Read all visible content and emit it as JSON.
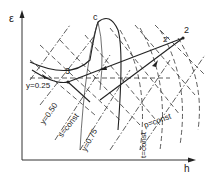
{
  "diagram": {
    "type": "thermodynamic-state-diagram",
    "axes": {
      "y_label": "ε",
      "x_label": "h"
    },
    "points": [
      {
        "id": "c",
        "label": "c",
        "role": "critical-point"
      },
      {
        "id": "1",
        "label": "1"
      },
      {
        "id": "2",
        "label": "2"
      },
      {
        "id": "2p",
        "label": "2'"
      },
      {
        "id": "3",
        "label": "3"
      }
    ],
    "quality_lines": [
      {
        "label": "y=0.25"
      },
      {
        "label": "y=0.50"
      },
      {
        "label": "y=0.75"
      }
    ],
    "isentrope_label": "s=const",
    "isobar_label": "p=const",
    "isotherm_label": "t=const"
  }
}
